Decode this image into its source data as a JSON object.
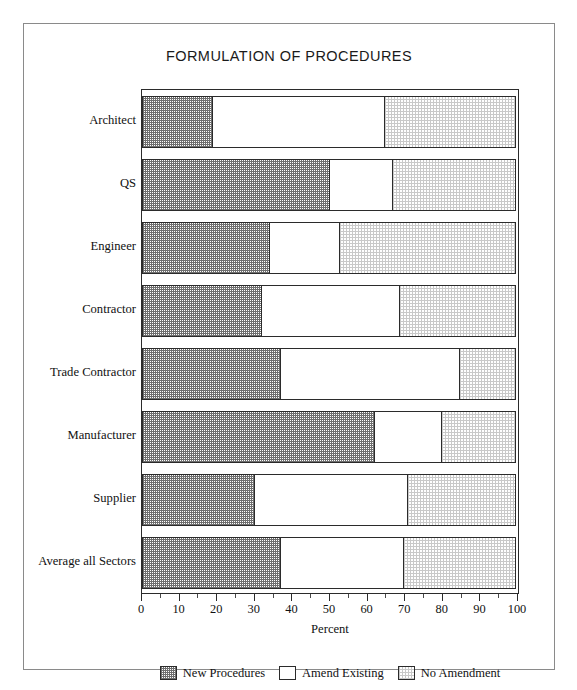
{
  "figure": {
    "title": "FORMULATION OF PROCEDURES"
  },
  "axis": {
    "x_title": "Percent",
    "tick_labels": [
      "0",
      "10",
      "20",
      "30",
      "40",
      "50",
      "60",
      "70",
      "80",
      "90",
      "100"
    ]
  },
  "legend": {
    "items": [
      {
        "label": "New Procedures",
        "pattern": "dark-checker"
      },
      {
        "label": "Amend Existing",
        "pattern": "white"
      },
      {
        "label": "No Amendment",
        "pattern": "light-checker"
      }
    ]
  },
  "chart_data": {
    "type": "bar",
    "orientation": "horizontal",
    "stacked": true,
    "title": "FORMULATION OF PROCEDURES",
    "xlabel": "Percent",
    "ylabel": "",
    "xlim": [
      0,
      100
    ],
    "xticks": [
      0,
      10,
      20,
      30,
      40,
      50,
      60,
      70,
      80,
      90,
      100
    ],
    "grid": false,
    "legend_position": "bottom",
    "categories": [
      "Architect",
      "QS",
      "Engineer",
      "Contractor",
      "Trade Contractor",
      "Manufacturer",
      "Supplier",
      "Average all Sectors"
    ],
    "series": [
      {
        "name": "New Procedures",
        "values": [
          19,
          50,
          34,
          32,
          37,
          62,
          30,
          37
        ]
      },
      {
        "name": "Amend Existing",
        "values": [
          46,
          17,
          19,
          37,
          48,
          18,
          41,
          33
        ]
      },
      {
        "name": "No Amendment",
        "values": [
          35,
          33,
          47,
          31,
          15,
          20,
          29,
          30
        ]
      }
    ]
  }
}
